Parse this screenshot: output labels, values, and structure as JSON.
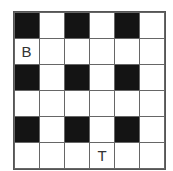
{
  "grid": {
    "rows": 6,
    "cols": 6,
    "cells": [
      [
        {
          "fill": "black",
          "label": ""
        },
        {
          "fill": "white",
          "label": ""
        },
        {
          "fill": "black",
          "label": ""
        },
        {
          "fill": "white",
          "label": ""
        },
        {
          "fill": "black",
          "label": ""
        },
        {
          "fill": "white",
          "label": ""
        }
      ],
      [
        {
          "fill": "white",
          "label": "B"
        },
        {
          "fill": "white",
          "label": ""
        },
        {
          "fill": "white",
          "label": ""
        },
        {
          "fill": "white",
          "label": ""
        },
        {
          "fill": "white",
          "label": ""
        },
        {
          "fill": "white",
          "label": ""
        }
      ],
      [
        {
          "fill": "black",
          "label": ""
        },
        {
          "fill": "white",
          "label": ""
        },
        {
          "fill": "black",
          "label": ""
        },
        {
          "fill": "white",
          "label": ""
        },
        {
          "fill": "black",
          "label": ""
        },
        {
          "fill": "white",
          "label": ""
        }
      ],
      [
        {
          "fill": "white",
          "label": ""
        },
        {
          "fill": "white",
          "label": ""
        },
        {
          "fill": "white",
          "label": ""
        },
        {
          "fill": "white",
          "label": ""
        },
        {
          "fill": "white",
          "label": ""
        },
        {
          "fill": "white",
          "label": ""
        }
      ],
      [
        {
          "fill": "black",
          "label": ""
        },
        {
          "fill": "white",
          "label": ""
        },
        {
          "fill": "black",
          "label": ""
        },
        {
          "fill": "white",
          "label": ""
        },
        {
          "fill": "black",
          "label": ""
        },
        {
          "fill": "white",
          "label": ""
        }
      ],
      [
        {
          "fill": "white",
          "label": ""
        },
        {
          "fill": "white",
          "label": ""
        },
        {
          "fill": "white",
          "label": ""
        },
        {
          "fill": "white",
          "label": "T"
        },
        {
          "fill": "white",
          "label": ""
        },
        {
          "fill": "white",
          "label": ""
        }
      ]
    ]
  },
  "colors": {
    "black_cell": "#141414",
    "white_cell": "#ffffff",
    "line": "#666666"
  }
}
